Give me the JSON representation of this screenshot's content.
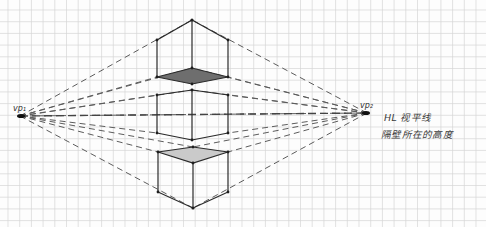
{
  "vanishing_points": [
    {
      "id": "vp1",
      "label": "vp₁",
      "x": 20,
      "y": 116
    },
    {
      "id": "vp2",
      "label": "vp₂",
      "x": 367,
      "y": 113
    }
  ],
  "annotations": [
    {
      "id": "horizon-note",
      "text": "HL 视平线"
    },
    {
      "id": "height-note",
      "text": "隔壁所在的高度"
    }
  ],
  "colors": {
    "grid": "#d4d4d4",
    "ink": "#2a2a2a",
    "dashed": "#6a6a6a",
    "shade_dark": "#6e6e6e",
    "shade_light": "#c8c8c8"
  },
  "cubes": [
    {
      "id": "top-cube",
      "position": "above horizon",
      "shaded_face": "bottom (dark)"
    },
    {
      "id": "middle-cube",
      "position": "on horizon",
      "shaded_face": "none"
    },
    {
      "id": "bottom-cube",
      "position": "below horizon",
      "shaded_face": "top (light)"
    }
  ]
}
